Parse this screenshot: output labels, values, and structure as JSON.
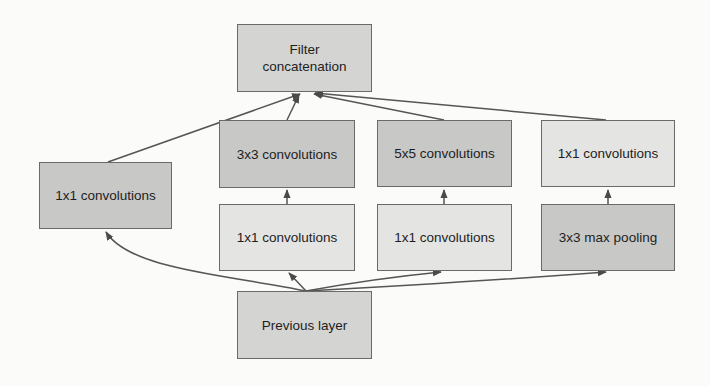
{
  "diagram": {
    "nodes": {
      "filter_concat": {
        "label_line1": "Filter",
        "label_line2": "concatenation"
      },
      "conv3x3": {
        "label": "3x3 convolutions"
      },
      "conv5x5": {
        "label": "5x5 convolutions"
      },
      "conv1x1_pool_proj": {
        "label": "1x1 convolutions"
      },
      "conv1x1_direct": {
        "label": "1x1 convolutions"
      },
      "conv1x1_reduce3": {
        "label": "1x1 convolutions"
      },
      "conv1x1_reduce5": {
        "label": "1x1 convolutions"
      },
      "maxpool3x3": {
        "label": "3x3 max pooling"
      },
      "previous_layer": {
        "label": "Previous layer"
      }
    },
    "edges": [
      {
        "from": "previous_layer",
        "to": "conv1x1_direct"
      },
      {
        "from": "previous_layer",
        "to": "conv1x1_reduce3"
      },
      {
        "from": "previous_layer",
        "to": "conv1x1_reduce5"
      },
      {
        "from": "previous_layer",
        "to": "maxpool3x3"
      },
      {
        "from": "conv1x1_reduce3",
        "to": "conv3x3"
      },
      {
        "from": "conv1x1_reduce5",
        "to": "conv5x5"
      },
      {
        "from": "maxpool3x3",
        "to": "conv1x1_pool_proj"
      },
      {
        "from": "conv1x1_direct",
        "to": "filter_concat"
      },
      {
        "from": "conv3x3",
        "to": "filter_concat"
      },
      {
        "from": "conv5x5",
        "to": "filter_concat"
      },
      {
        "from": "conv1x1_pool_proj",
        "to": "filter_concat"
      }
    ]
  }
}
